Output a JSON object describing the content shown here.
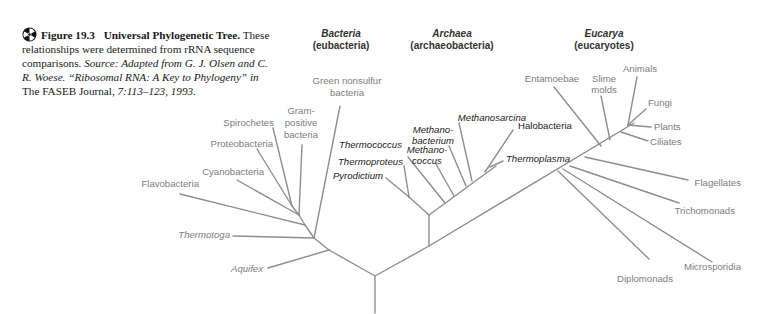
{
  "caption": {
    "figure_number": "Figure 19.3",
    "title": "Universal Phylogenetic Tree.",
    "text_1": "These relationships were determined from rRNA sequence comparisons.",
    "source_prefix": "Source: Adapted from G. J. Olsen and C. R. Woese. “Ribosomal RNA: A Key to Phylogeny”",
    "in_word": "in",
    "journal": "The FASEB Journal,",
    "citation": "7:113–123, 1993.",
    "icon": "cd-media-icon"
  },
  "domains": [
    {
      "name": "Bacteria",
      "subtitle": "(eubacteria)"
    },
    {
      "name": "Archaea",
      "subtitle": "(archaeobacteria)"
    },
    {
      "name": "Eucarya",
      "subtitle": "(eucaryotes)"
    }
  ],
  "bacteria": {
    "green_nonsulfur": [
      "Green nonsulfur",
      "bacteria"
    ],
    "gram_positive": [
      "Gram-",
      "positive",
      "bacteria"
    ],
    "spirochetes": "Spirochetes",
    "proteobacteria": "Proteobacteria",
    "cyanobacteria": "Cyanobacteria",
    "flavobacteria": "Flavobacteria",
    "thermotoga": "Thermotoga",
    "aquifex": "Aquifex"
  },
  "archaea": {
    "methanosarcina": "Methanosarcina",
    "methanobacterium": [
      "Methano-",
      "bacterium"
    ],
    "methanococcus": [
      "Methano-",
      "coccus"
    ],
    "thermococcus": "Thermococcus",
    "thermoproteus": "Thermoproteus",
    "pyrodictium": "Pyrodictium",
    "halobacteria": "Halobacteria",
    "thermoplasma": "Thermoplasma"
  },
  "eucarya": {
    "entamoebae": "Entamoebae",
    "slime_molds": [
      "Slime",
      "molds"
    ],
    "animals": "Animals",
    "fungi": "Fungi",
    "plants": "Plants",
    "ciliates": "Ciliates",
    "flagellates": "Flagellates",
    "trichomonads": "Trichomonads",
    "microsporidia": "Microsporidia",
    "diplomonads": "Diplomonads"
  },
  "colors": {
    "branch": "#8e8e8e",
    "label_gray": "#7d7d7d",
    "label_dark": "#222222"
  }
}
